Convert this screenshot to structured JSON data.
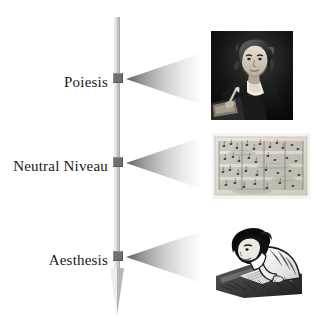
{
  "diagram": {
    "axis": {
      "name": "vertical-process-axis",
      "direction": "downward",
      "arrow_at": "bottom"
    },
    "stages": [
      {
        "id": "poiesis",
        "label": "Poiesis",
        "node_label": "poiesis-node",
        "cone_label": "poiesis-cone",
        "image": {
          "name": "composer-portrait",
          "caption": "Composer portrait",
          "alt": "Portrait of a composer seated at a desk with quill and papers"
        }
      },
      {
        "id": "neutral-niveau",
        "label": "Neutral Niveau",
        "node_label": "neutral-niveau-node",
        "cone_label": "neutral-niveau-cone",
        "image": {
          "name": "manuscript-score",
          "caption": "Handwritten manuscript score",
          "alt": "Aged handwritten musical manuscript with staves and notes"
        }
      },
      {
        "id": "aesthesis",
        "label": "Aesthesis",
        "node_label": "aesthesis-node",
        "cone_label": "aesthesis-cone",
        "image": {
          "name": "listener-reader",
          "caption": "Listener reading at a desk",
          "alt": "Person leaning over a desk reading a score"
        }
      }
    ],
    "colors": {
      "background": "#ffffff",
      "axis_light": "#f2f2f2",
      "axis_dark": "#a8a8a8",
      "node": "#6f6f6f",
      "cone_apex": "#5d5d5d",
      "cone_base": "#ffffff",
      "text": "#1a1a1a"
    }
  }
}
